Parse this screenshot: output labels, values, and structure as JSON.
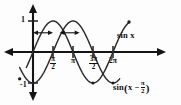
{
  "figure": {
    "background_color": "#fdfdfd",
    "curve_color": "#2b2b2b",
    "axis_color": "#141414"
  },
  "axes": {
    "y_label_positive": "1",
    "y_label_negative": "-1",
    "x_tick_labels": [
      {
        "id": "pi-over-2",
        "numerator": "π",
        "denominator": "2",
        "value": 1.5707963
      },
      {
        "id": "pi",
        "text": "π",
        "value": 3.1415927
      },
      {
        "id": "three-pi-over-2",
        "numerator": "3π",
        "denominator": "2",
        "value": 4.712389
      },
      {
        "id": "two-pi",
        "text": "2π",
        "value": 6.2831853
      }
    ]
  },
  "annotations": {
    "curve_label_top": "sin x",
    "curve_label_bottom_prefix": "sin",
    "curve_label_bottom_open": "(",
    "curve_label_bottom_var": "x −",
    "curve_label_bottom_num": "π",
    "curve_label_bottom_den": "2",
    "curve_label_bottom_close": ")",
    "shift_arrows": [
      {
        "id": "shift-arrow-1",
        "from_x": 0.0,
        "to_x": 1.5707963,
        "at_y": 0.62
      },
      {
        "id": "shift-arrow-2",
        "from_x": 2.0943951,
        "to_x": 3.6651914,
        "at_y": 0.62
      }
    ]
  },
  "chart_data": {
    "type": "line",
    "xlabel": "",
    "ylabel": "",
    "xlim": [
      -1.0471976,
      8.3775804
    ],
    "ylim": [
      -1.35,
      1.35
    ],
    "grid": false,
    "legend": "inline-curve-labels",
    "x_ticks": [
      1.5707963,
      3.1415927,
      4.712389,
      6.2831853
    ],
    "x_tick_text": [
      "π/2",
      "π",
      "3π/2",
      "2π"
    ],
    "y_ticks": [
      -1,
      1
    ],
    "y_tick_text": [
      "-1",
      "1"
    ],
    "series": [
      {
        "name": "sin x",
        "expression": "sin(x)",
        "amplitude": 1,
        "period": 6.2831853,
        "phase_shift": 0,
        "x_start": -0.5235988,
        "x_end": 7.5398224,
        "endpoint_markers": [
          {
            "x": 7.5398224,
            "y": 0.9659258
          }
        ],
        "key_points": [
          {
            "x": 0,
            "y": 0
          },
          {
            "x": 1.5707963,
            "y": 1
          },
          {
            "x": 3.1415927,
            "y": 0
          },
          {
            "x": 4.712389,
            "y": -1
          },
          {
            "x": 6.2831853,
            "y": 0
          },
          {
            "x": 7.5398224,
            "y": 0.9659258
          }
        ]
      },
      {
        "name": "sin (x - π/2)",
        "expression": "sin(x - π/2)",
        "amplitude": 1,
        "period": 6.2831853,
        "phase_shift": 1.5707963,
        "x_start": -1.0471976,
        "x_end": 6.8067841,
        "endpoint_markers": [
          {
            "x": -1.0471976,
            "y": -0.8660254
          }
        ],
        "key_points": [
          {
            "x": -1.0471976,
            "y": -0.8660254
          },
          {
            "x": 0,
            "y": -1
          },
          {
            "x": 1.5707963,
            "y": 0
          },
          {
            "x": 3.1415927,
            "y": 1
          },
          {
            "x": 4.712389,
            "y": 0
          },
          {
            "x": 6.2831853,
            "y": -1
          },
          {
            "x": 6.8067841,
            "y": -0.8660254
          }
        ]
      }
    ]
  }
}
